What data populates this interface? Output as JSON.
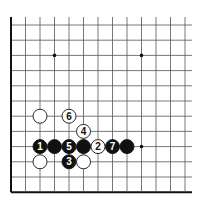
{
  "diagram": {
    "grid": {
      "columns": 13,
      "rows": 12,
      "origin_x": 11,
      "origin_y": 25,
      "spacing_x": 14.5,
      "spacing_y": 15.2,
      "extend_right_to": 192,
      "extend_top_to": 17,
      "edges": [
        "left",
        "bottom"
      ]
    },
    "colors": {
      "line": "#555555",
      "edge": "#111111",
      "black_stone": "#111111",
      "white_stone": "#ffffff",
      "black_label": "#ffffff",
      "white_label": "#111111"
    },
    "star_points": [
      {
        "col": 3,
        "row": 2
      },
      {
        "col": 9,
        "row": 2
      },
      {
        "col": 9,
        "row": 8
      }
    ],
    "stones": [
      {
        "color": "white",
        "col": 2,
        "row": 6,
        "label": ""
      },
      {
        "color": "white",
        "col": 4,
        "row": 6,
        "label": "6"
      },
      {
        "color": "white",
        "col": 5,
        "row": 7,
        "label": "4"
      },
      {
        "color": "black",
        "col": 2,
        "row": 8,
        "label": "1"
      },
      {
        "color": "black",
        "col": 3,
        "row": 8,
        "label": ""
      },
      {
        "color": "black",
        "col": 4,
        "row": 8,
        "label": "5"
      },
      {
        "color": "black",
        "col": 5,
        "row": 8,
        "label": ""
      },
      {
        "color": "white",
        "col": 6,
        "row": 8,
        "label": "2"
      },
      {
        "color": "black",
        "col": 7,
        "row": 8,
        "label": "7"
      },
      {
        "color": "black",
        "col": 8,
        "row": 8,
        "label": ""
      },
      {
        "color": "white",
        "col": 2,
        "row": 9,
        "label": ""
      },
      {
        "color": "black",
        "col": 4,
        "row": 9,
        "label": "3"
      },
      {
        "color": "white",
        "col": 5,
        "row": 9,
        "label": ""
      }
    ]
  }
}
